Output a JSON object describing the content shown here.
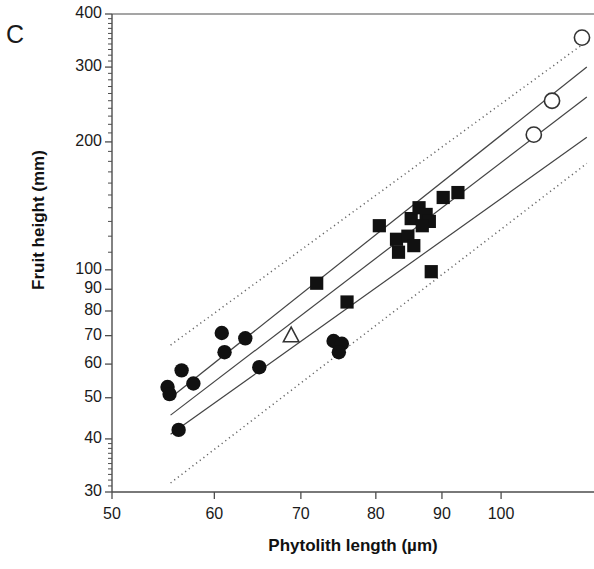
{
  "panel": {
    "label": "C"
  },
  "axes": {
    "x": {
      "label": "Phytolith length  (µm)",
      "scale": "log",
      "ticks": [
        50,
        60,
        70,
        80,
        90,
        100
      ],
      "tick_labels": [
        "50",
        "60",
        "70",
        "80",
        "90",
        "100"
      ],
      "range": [
        50,
        118
      ]
    },
    "y": {
      "label": "Fruit height  (mm)",
      "scale": "log",
      "ticks": [
        30,
        40,
        50,
        60,
        70,
        80,
        90,
        100,
        200,
        300,
        400
      ],
      "tick_labels": [
        "30",
        "40",
        "50",
        "60",
        "70",
        "80",
        "90",
        "100",
        "200",
        "300",
        "400"
      ],
      "range": [
        30,
        400
      ]
    }
  },
  "style": {
    "axis_color": "#4d4d4d",
    "marker_fill": "#111111",
    "marker_open_stroke": "#333333",
    "line_color": "#444444",
    "dotted_color": "#666666",
    "background": "#ffffff"
  },
  "chart_data": {
    "type": "scatter",
    "title": "",
    "xlabel": "Phytolith length  (µm)",
    "ylabel": "Fruit height  (mm)",
    "xscale": "log",
    "yscale": "log",
    "xlim": [
      50,
      118
    ],
    "ylim": [
      30,
      400
    ],
    "grid": false,
    "legend": "none",
    "series": [
      {
        "name": "filled-circles",
        "marker": "filled-circle",
        "points": [
          [
            55.2,
            53
          ],
          [
            55.4,
            51
          ],
          [
            56.3,
            42
          ],
          [
            56.6,
            58
          ],
          [
            57.8,
            54
          ],
          [
            60.8,
            71
          ],
          [
            61.1,
            64
          ],
          [
            63.4,
            69
          ],
          [
            65.0,
            59
          ],
          [
            74.2,
            68
          ],
          [
            75.3,
            67
          ],
          [
            74.9,
            64
          ]
        ]
      },
      {
        "name": "filled-squares",
        "marker": "filled-square",
        "points": [
          [
            72.0,
            93
          ],
          [
            76.0,
            84
          ],
          [
            80.5,
            127
          ],
          [
            83.0,
            118
          ],
          [
            84.7,
            120
          ],
          [
            85.2,
            132
          ],
          [
            85.6,
            114
          ],
          [
            86.4,
            140
          ],
          [
            87.5,
            135
          ],
          [
            88.0,
            130
          ],
          [
            88.3,
            99
          ],
          [
            90.2,
            148
          ],
          [
            92.6,
            152
          ],
          [
            83.3,
            110
          ],
          [
            86.9,
            127
          ]
        ]
      },
      {
        "name": "open-circles",
        "marker": "open-circle",
        "points": [
          [
            106.0,
            208
          ],
          [
            109.5,
            250
          ],
          [
            115.5,
            352
          ]
        ]
      },
      {
        "name": "open-triangle",
        "marker": "open-triangle",
        "points": [
          [
            68.8,
            70
          ]
        ]
      }
    ],
    "fit_lines": [
      {
        "name": "upper-regression-line",
        "style": "solid",
        "x": [
          55.5,
          116.5
        ],
        "y": [
          50.0,
          300.0
        ]
      },
      {
        "name": "middle-regression-line",
        "style": "solid",
        "x": [
          55.5,
          116.5
        ],
        "y": [
          45.5,
          255.0
        ]
      },
      {
        "name": "lower-regression-line",
        "style": "solid",
        "x": [
          55.5,
          116.5
        ],
        "y": [
          41.0,
          205.0
        ]
      },
      {
        "name": "upper-prediction-bound",
        "style": "dotted",
        "x": [
          55.5,
          116.5
        ],
        "y": [
          66.5,
          345.0
        ]
      },
      {
        "name": "lower-prediction-bound",
        "style": "dotted",
        "x": [
          55.5,
          116.5
        ],
        "y": [
          31.5,
          178.0
        ]
      }
    ]
  }
}
